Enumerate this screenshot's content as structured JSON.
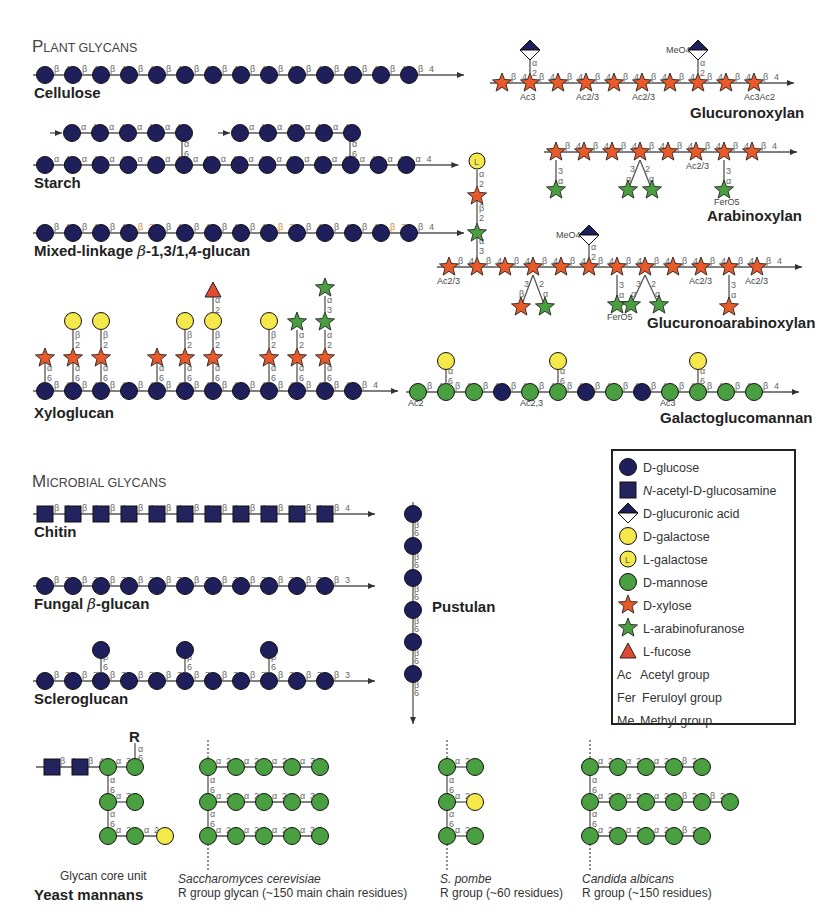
{
  "colors": {
    "glucose": "#1f1f5c",
    "glcnac": "#23235e",
    "glucuronic": "#1f1f5c",
    "galactose": "#f5e84a",
    "mannose": "#4aa040",
    "xylose": "#e85a2a",
    "arabinose": "#4a9e40",
    "fucose": "#e04a32",
    "r_group": "#c8532a",
    "line": "#555555"
  },
  "sections": {
    "plant": {
      "title_cap": "P",
      "title_rest": "LANT GLYCANS"
    },
    "microbial": {
      "title_cap": "M",
      "title_rest": "ICROBIAL GLYCANS"
    }
  },
  "glycans": {
    "cellulose": {
      "name": "Cellulose",
      "residues": 14,
      "link_a": "β",
      "link_b": "4"
    },
    "starch": {
      "name": "Starch",
      "residues": 14,
      "branch_residues": 5,
      "link_a": "α",
      "link_b": "4",
      "branch_link": [
        "α",
        "6"
      ]
    },
    "mixed": {
      "name": "Mixed-linkage β-1,3/1,4-glucan",
      "residues": 14,
      "link_a": "β",
      "link_b": "4",
      "alt_b": "3",
      "alt_positions": [
        3,
        8,
        12
      ]
    },
    "glucuronoxylan": {
      "name": "Glucuronoxylan",
      "residues": 10,
      "link_a": "β",
      "link_b": "4",
      "mods": [
        {
          "i": 1,
          "t": "Ac3"
        },
        {
          "i": 3,
          "t": "Ac2/3"
        },
        {
          "i": 5,
          "t": "Ac2/3"
        },
        {
          "i": 9,
          "t": "Ac3Ac2"
        }
      ],
      "side_link": [
        "α",
        "2"
      ],
      "meo": "MeO4"
    },
    "arabinoxylan": {
      "name": "Arabinoxylan",
      "residues": 8,
      "link_a": "β",
      "link_b": "4",
      "mod": "Ac2/3",
      "fer": "FerO5"
    },
    "gax": {
      "name": "Glucuronoarabinoxylan",
      "residues": 12,
      "link_a": "β",
      "link_b": "4",
      "mods": [
        {
          "i": 0,
          "t": "Ac2/3"
        },
        {
          "i": 9,
          "t": "Ac2/3"
        },
        {
          "i": 11,
          "t": "Ac2/3"
        }
      ],
      "fer": "FerO5",
      "meo": "MeO4"
    },
    "xyloglucan": {
      "name": "Xyloglucan",
      "residues": 12,
      "link_a": "β",
      "link_b": "4",
      "side_link": [
        "α",
        "6"
      ],
      "gal_link": [
        "β",
        "2"
      ]
    },
    "galactoglucomannan": {
      "name": "Galactoglucomannan",
      "residues": 13,
      "link_a": "β",
      "link_b": "4",
      "mods": [
        {
          "i": 0,
          "t": "Ac2"
        },
        {
          "i": 4,
          "t": "Ac2,3"
        },
        {
          "i": 9,
          "t": "Ac3"
        }
      ],
      "side_link": [
        "α",
        "6"
      ]
    },
    "chitin": {
      "name": "Chitin",
      "residues": 11,
      "link_a": "β",
      "link_b": "4"
    },
    "fungal": {
      "name": "Fungal β-glucan",
      "residues": 11,
      "link_a": "β",
      "link_b": "3"
    },
    "scleroglucan": {
      "name": "Scleroglucan",
      "residues": 11,
      "link_a": "β",
      "link_b": "3",
      "side_link": [
        "β",
        "6"
      ]
    },
    "pustulan": {
      "name": "Pustulan",
      "residues": 6,
      "link_a": "β",
      "link_b": "6"
    }
  },
  "yeast": {
    "name": "Yeast mannans",
    "core_caption": "Glycan core unit",
    "r_label": "R",
    "species": [
      {
        "name": "Saccharomyces cerevisiae",
        "desc": "R group glycan (~150 main chain residues)"
      },
      {
        "name": "S. pombe",
        "desc": "R group (~60 residues)"
      },
      {
        "name": "Candida albicans",
        "desc": "R group (~150 residues)"
      }
    ]
  },
  "legend": {
    "items": [
      {
        "symbol": "glucose",
        "label": "D-glucose"
      },
      {
        "symbol": "glcnac",
        "label_italic": "N",
        "label": "-acetyl-D-glucosamine"
      },
      {
        "symbol": "glucuronic",
        "label": "D-glucuronic acid"
      },
      {
        "symbol": "galactose",
        "label": "D-galactose"
      },
      {
        "symbol": "lgalactose",
        "label": "L-galactose"
      },
      {
        "symbol": "mannose",
        "label": "D-mannose"
      },
      {
        "symbol": "xylose",
        "label": "D-xylose"
      },
      {
        "symbol": "arabinose",
        "label": "L-arabinofuranose"
      },
      {
        "symbol": "fucose",
        "label": "L-fucose"
      },
      {
        "abbr": "Ac",
        "label": "Acetyl group"
      },
      {
        "abbr": "Fer",
        "label": "Feruloyl group"
      },
      {
        "abbr": "Me",
        "label": "Methyl group"
      }
    ]
  }
}
